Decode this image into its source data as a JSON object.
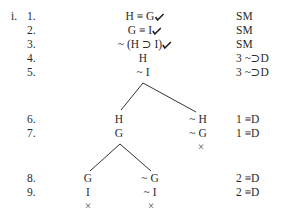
{
  "problem": {
    "label": "i.",
    "lines": [
      {
        "num": "1.",
        "formula": "H ≡ G",
        "checked": true,
        "justification": "SM"
      },
      {
        "num": "2.",
        "formula": "G ≡ I",
        "checked": true,
        "justification": "SM"
      },
      {
        "num": "3.",
        "formula": "~ (H ⊃ I)",
        "checked": true,
        "justification": "SM"
      },
      {
        "num": "4.",
        "formula": "H",
        "justification": "3 ~⊃D"
      },
      {
        "num": "5.",
        "formula": "~ I",
        "justification": "3 ~⊃D"
      },
      {
        "num": "6.",
        "left": "H",
        "right": "~ H",
        "justification": "1 ≡D"
      },
      {
        "num": "7.",
        "left": "G",
        "right": "~ G",
        "justification": "1 ≡D"
      },
      {
        "num": "8.",
        "left": "G",
        "right": "~ G",
        "justification": "2 ≡D"
      },
      {
        "num": "9.",
        "left": "I",
        "right": "~ I",
        "justification": "2 ≡D"
      }
    ],
    "closed_marker": "×"
  }
}
